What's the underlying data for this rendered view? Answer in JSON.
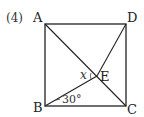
{
  "problem": {
    "number_label": "(4)"
  },
  "figure": {
    "shape": "square",
    "vertices": {
      "A": "A",
      "B": "B",
      "C": "C",
      "D": "D",
      "E": "E"
    },
    "segments": [
      "AB",
      "BC",
      "CD",
      "DA",
      "AC",
      "BD'"
    ],
    "angle_label": "30°",
    "unknown_label": "x",
    "line_color": "#222222"
  }
}
